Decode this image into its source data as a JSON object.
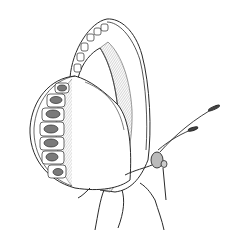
{
  "image": {
    "subject": "butterfly line drawing, side view with wings closed",
    "background": "#ffffff",
    "ink": "#2a2a2a",
    "hatch": "#8a8a8a",
    "spot_fill": "#7a7a7a"
  }
}
